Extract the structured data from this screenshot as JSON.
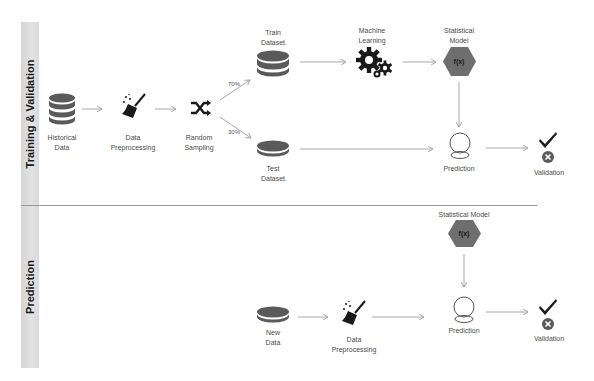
{
  "sections": {
    "training": {
      "title": "Training & Validation"
    },
    "prediction": {
      "title": "Prediction"
    }
  },
  "training_flow": {
    "historical_data": "Historical\nData",
    "preprocessing": "Data\nPreprocessing",
    "random_sampling": "Random\nSampling",
    "train_dataset": "Train\nDataset",
    "test_dataset": "Test\nDataset",
    "machine_learning": "Machine\nLearning",
    "statistical_model": "Statistical\nModel",
    "model_symbol": "f(x)",
    "prediction": "Prediction",
    "validation": "Validation",
    "split_train": "70%",
    "split_test": "30%"
  },
  "prediction_flow": {
    "statistical_model": "Statistical Model",
    "model_symbol": "f(x)",
    "new_data": "New\nData",
    "preprocessing": "Data\nPreprocessing",
    "prediction": "Prediction",
    "validation": "Validation"
  },
  "colors": {
    "icon_dark": "#5a5a5a",
    "hexagon": "#6e6e6e",
    "band": "#dcdcdc",
    "arrow": "#a8a8a8"
  }
}
